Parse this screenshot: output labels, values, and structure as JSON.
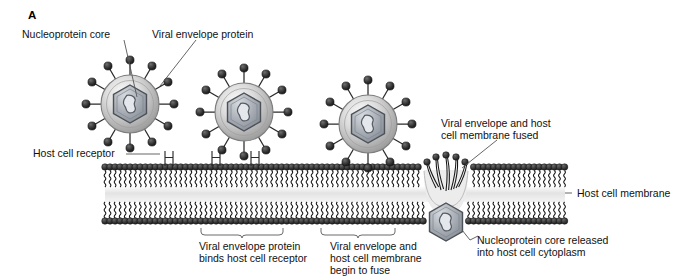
{
  "figure": {
    "panel_letter": "A",
    "title_absent": true
  },
  "labels": {
    "nucleoprotein_core": "Nucleoprotein core",
    "viral_envelope_protein": "Viral envelope protein",
    "host_cell_receptor": "Host cell receptor",
    "host_cell_membrane": "Host cell membrane",
    "fused_line1": "Viral envelope and host",
    "fused_line2": "cell membrane fused",
    "released_line1": "Nucleoprotein core released",
    "released_line2": "into host cell cytoplasm"
  },
  "captions": [
    {
      "id": "binds",
      "lines": [
        "Viral envelope protein",
        "binds host cell receptor"
      ]
    },
    {
      "id": "fusing",
      "lines": [
        "Viral envelope and",
        "host cell membrane",
        "begin to fuse"
      ]
    }
  ],
  "stages": [
    {
      "id": "virion-free-1",
      "description": "Free enveloped virion with spikes"
    },
    {
      "id": "virion-bound-2",
      "description": "Virion binding host cell receptor"
    },
    {
      "id": "virion-fusing-3",
      "description": "Virion membrane beginning to fuse"
    },
    {
      "id": "fusion-site",
      "description": "Viral envelope and host cell membrane fused"
    },
    {
      "id": "core-released",
      "description": "Nucleoprotein core released into cytoplasm"
    }
  ],
  "colors": {
    "membrane_head": "#3a3a3a",
    "membrane_tail": "#1a1a1a",
    "envelope_light": "#f2f2f2",
    "envelope_mid": "#b8b8b8",
    "envelope_dark": "#8a8a8a",
    "core_fill": "#9fa4ac",
    "core_stroke": "#4c5158",
    "spike_head": "#2e2e2e",
    "text": "#111111",
    "leader": "#555555",
    "interior": "#e8e8e8"
  },
  "counts": {
    "virions": 3,
    "spikes_per_virion": 12,
    "receptors": 2
  }
}
